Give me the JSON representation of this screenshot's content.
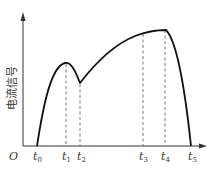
{
  "diagram": {
    "y_axis_label": "电流信号",
    "origin_label": "O",
    "time_marks": [
      {
        "base": "t",
        "sub": "0",
        "x": 37
      },
      {
        "base": "t",
        "sub": "1",
        "x": 66
      },
      {
        "base": "t",
        "sub": "2",
        "x": 80
      },
      {
        "base": "t",
        "sub": "3",
        "x": 143
      },
      {
        "base": "t",
        "sub": "4",
        "x": 165
      },
      {
        "base": "t",
        "sub": "5",
        "x": 191
      }
    ]
  }
}
